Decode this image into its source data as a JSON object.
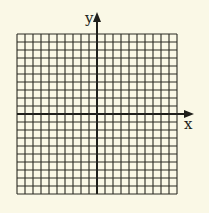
{
  "diagram": {
    "type": "coordinate-grid",
    "axes": {
      "x_label": "x",
      "y_label": "y"
    },
    "grid": {
      "columns": 20,
      "rows": 20,
      "cell_size_px": 8,
      "origin_column": 10,
      "origin_row": 10
    },
    "colors": {
      "background": "#faf8e6",
      "line": "#2a2a22"
    }
  }
}
